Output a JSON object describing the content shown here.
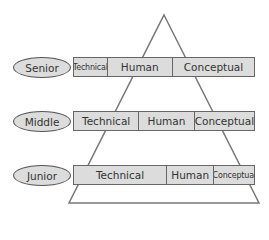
{
  "diagram": {
    "shape": "pyramid",
    "levels": [
      {
        "name": "Senior",
        "segments": [
          {
            "label": "Technical",
            "width": 34,
            "small": true
          },
          {
            "label": "Human",
            "width": 66,
            "small": false
          },
          {
            "label": "Conceptual",
            "width": 82,
            "small": false
          }
        ]
      },
      {
        "name": "Middle",
        "segments": [
          {
            "label": "Technical",
            "width": 66,
            "small": false
          },
          {
            "label": "Human",
            "width": 56,
            "small": false
          },
          {
            "label": "Conceptual",
            "width": 60,
            "small": false
          }
        ]
      },
      {
        "name": "Junior",
        "segments": [
          {
            "label": "Technical",
            "width": 94,
            "small": false
          },
          {
            "label": "Human",
            "width": 48,
            "small": false
          },
          {
            "label": "Conceptual",
            "width": 40,
            "small": true
          }
        ]
      }
    ],
    "colors": {
      "fill": "#dcdcdc",
      "stroke": "#666666",
      "text": "#333333"
    }
  }
}
